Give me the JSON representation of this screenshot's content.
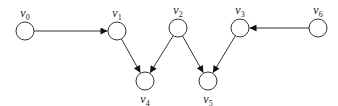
{
  "diagram": {
    "type": "directed-graph",
    "nodes": [
      {
        "id": "v0",
        "label": "v",
        "sub": "0",
        "x": 25,
        "y": 31,
        "label_pos": "above"
      },
      {
        "id": "v1",
        "label": "v",
        "sub": "1",
        "x": 117,
        "y": 31,
        "label_pos": "above"
      },
      {
        "id": "v2",
        "label": "v",
        "sub": "2",
        "x": 178,
        "y": 28,
        "label_pos": "above"
      },
      {
        "id": "v3",
        "label": "v",
        "sub": "3",
        "x": 240,
        "y": 28,
        "label_pos": "above"
      },
      {
        "id": "v4",
        "label": "v",
        "sub": "4",
        "x": 145,
        "y": 81,
        "label_pos": "below"
      },
      {
        "id": "v5",
        "label": "v",
        "sub": "5",
        "x": 208,
        "y": 81,
        "label_pos": "below"
      },
      {
        "id": "v6",
        "label": "v",
        "sub": "6",
        "x": 318,
        "y": 28,
        "label_pos": "above"
      }
    ],
    "edges": [
      {
        "from": "v0",
        "to": "v1"
      },
      {
        "from": "v1",
        "to": "v4"
      },
      {
        "from": "v2",
        "to": "v4"
      },
      {
        "from": "v2",
        "to": "v5"
      },
      {
        "from": "v3",
        "to": "v5"
      },
      {
        "from": "v6",
        "to": "v3"
      }
    ],
    "node_radius": 9,
    "colors": {
      "stroke": "#333333",
      "fill": "#ffffff",
      "text": "#222222"
    }
  }
}
